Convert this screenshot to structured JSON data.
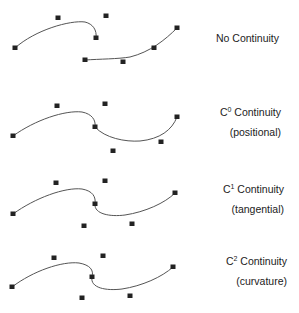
{
  "colors": {
    "curve": "#555555",
    "control_point": "#222222",
    "text": "#222222",
    "background": "#ffffff"
  },
  "panels": [
    {
      "id": "no-continuity",
      "label": {
        "prefix": "No Continuity",
        "sup": "",
        "suffix": ""
      },
      "sublabel": "",
      "curves": [
        {
          "points": [
            [
              15,
              48
            ],
            [
              58,
              18
            ],
            [
              96,
              38
            ],
            [
              106,
              16
            ]
          ],
          "path": "M15,48 C35,30 70,20 85,22 C93,24 97,30 96,38"
        },
        {
          "points": [
            [
              85,
              60
            ],
            [
              123,
              62
            ],
            [
              154,
              48
            ],
            [
              177,
              28
            ]
          ],
          "path": "M85,60 C100,59 118,59 130,57 C150,52 165,40 177,28"
        }
      ],
      "control_points": [
        [
          15,
          48
        ],
        [
          58,
          18
        ],
        [
          96,
          38
        ],
        [
          106,
          16
        ],
        [
          85,
          60
        ],
        [
          123,
          62
        ],
        [
          154,
          48
        ],
        [
          177,
          28
        ]
      ]
    },
    {
      "id": "c0",
      "label": {
        "prefix": "C",
        "sup": "0",
        "suffix": " Continuity"
      },
      "sublabel": "(positional)",
      "curves": [
        {
          "path": "M13,136 C35,120 65,110 82,112 C92,114 96,120 95,127"
        },
        {
          "path": "M95,127 C105,138 125,142 140,141 C160,139 172,130 177,117"
        }
      ],
      "control_points": [
        [
          13,
          136
        ],
        [
          57,
          106
        ],
        [
          95,
          127
        ],
        [
          105,
          104
        ],
        [
          113,
          151
        ],
        [
          161,
          142
        ],
        [
          177,
          117
        ]
      ]
    },
    {
      "id": "c1",
      "label": {
        "prefix": "C",
        "sup": "1",
        "suffix": " Continuity"
      },
      "sublabel": "(tangential)",
      "curves": [
        {
          "path": "M13,214 C35,198 65,187 82,189 C93,191 96,197 95,204"
        },
        {
          "path": "M95,204 C94,214 110,217 125,215 C145,212 165,203 175,193"
        }
      ],
      "control_points": [
        [
          13,
          214
        ],
        [
          56,
          183
        ],
        [
          95,
          204
        ],
        [
          105,
          181
        ],
        [
          84,
          226
        ],
        [
          132,
          224
        ],
        [
          175,
          193
        ]
      ]
    },
    {
      "id": "c2",
      "label": {
        "prefix": "C",
        "sup": "2",
        "suffix": " Continuity"
      },
      "sublabel": "(curvature)",
      "curves": [
        {
          "path": "M12,287 C33,271 62,261 79,263 C90,265 94,270 92,277"
        },
        {
          "path": "M92,277 C90,288 106,291 122,289 C142,286 162,277 173,267"
        }
      ],
      "control_points": [
        [
          12,
          287
        ],
        [
          54,
          258
        ],
        [
          92,
          277
        ],
        [
          103,
          256
        ],
        [
          82,
          298
        ],
        [
          130,
          296
        ],
        [
          173,
          267
        ]
      ]
    }
  ]
}
